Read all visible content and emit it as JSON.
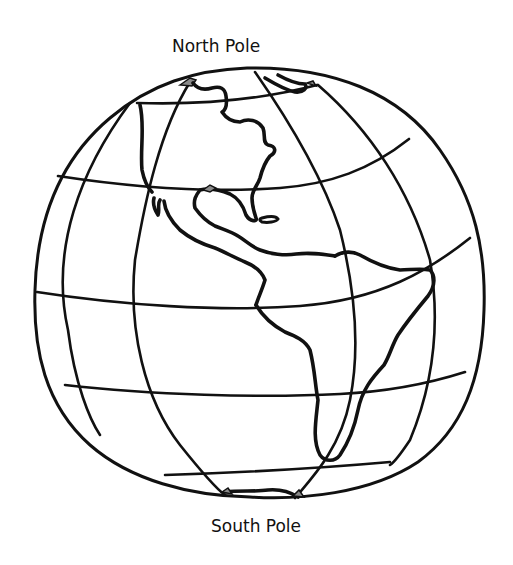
{
  "labels": {
    "north_pole": "North Pole",
    "south_pole": "South Pole"
  },
  "illustration": {
    "subject": "globe-western-hemisphere",
    "style": "black line art coloring page",
    "continents_visible": [
      "North America",
      "Central America",
      "South America"
    ],
    "colors": {
      "background": "#ffffff",
      "line": "#111111",
      "polar_ice_fill": "#8a8a8a"
    }
  }
}
